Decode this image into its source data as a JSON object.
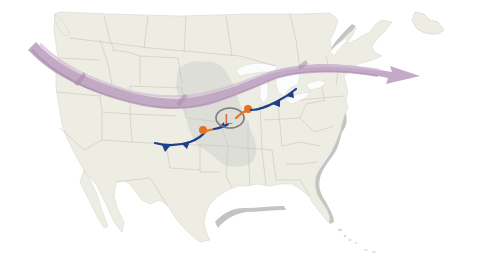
{
  "map": {
    "type": "weather-front-map",
    "region": "North America",
    "colors": {
      "background": "#ffffff",
      "ocean": "#fbfcfd",
      "land": "#eeede3",
      "land_shadow": "#b9b9b9",
      "borders": "#c8c8c0",
      "lakes": "#fbfcfd",
      "shaded_region": "#dcdcd6",
      "jet_stream": "#bea4c2",
      "jet_stream_dark": "#a88aad",
      "cold_front": "#1f3f8a",
      "warm_front": "#e8701e",
      "low_ring": "#7d7d78",
      "low_label": "#e06a1a"
    }
  },
  "features": {
    "jet_stream": {
      "label": "jet-stream",
      "direction": "west-to-east"
    },
    "low_pressure": {
      "symbol": "L"
    },
    "cold_front_west": {
      "label": "cold-front"
    },
    "warm_front_west": {
      "label": "warm-front"
    },
    "cold_front_east": {
      "label": "cold-front"
    },
    "warm_front_east": {
      "label": "warm-front"
    }
  }
}
